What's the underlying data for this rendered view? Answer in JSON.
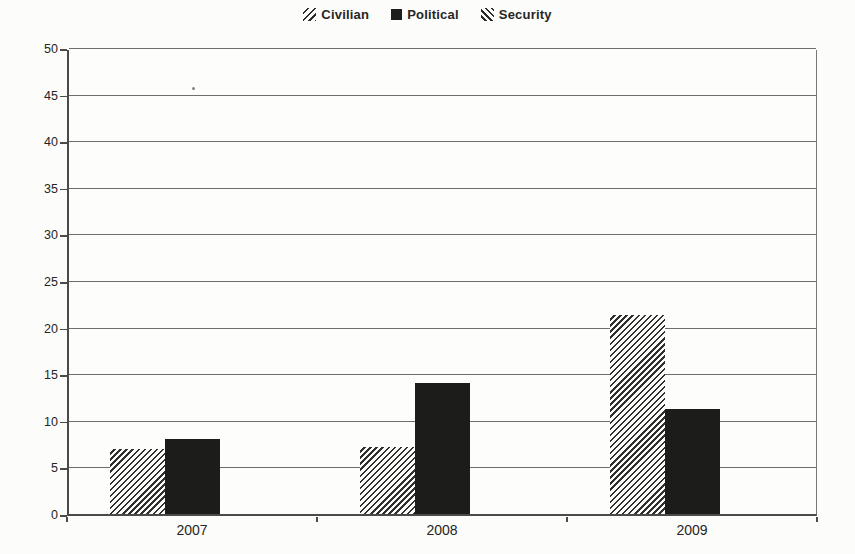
{
  "legend": {
    "position": "top-center",
    "items": [
      {
        "label": "Civilian",
        "marker": "diagonal-hatch-forward-slash"
      },
      {
        "label": "Political",
        "marker": "solid-black-square"
      },
      {
        "label": "Security",
        "marker": "diagonal-hatch-back-slash"
      }
    ]
  },
  "chart_data": {
    "type": "bar",
    "title": "",
    "xlabel": "",
    "ylabel": "",
    "categories": [
      "2007",
      "2008",
      "2009"
    ],
    "series": [
      {
        "name": "Civilian",
        "values": [
          7.0,
          7.2,
          21.3
        ],
        "fill": "hatch-forward"
      },
      {
        "name": "Political",
        "values": [
          8.0,
          14.1,
          11.3
        ],
        "fill": "solid-black"
      },
      {
        "name": "Security",
        "values": [
          42.0,
          37.3,
          43.4
        ],
        "fill": "hatch-back"
      }
    ],
    "ylim": [
      0,
      50
    ],
    "yticks": [
      0,
      5,
      10,
      15,
      20,
      25,
      30,
      35,
      40,
      45,
      50
    ],
    "grid": true,
    "legend_position": "top-center"
  },
  "colors": {
    "ink": "#252523",
    "bar_black": "#1c1c1a",
    "hatch_line": "#2e2e2c",
    "gridline": "#6e6e6c",
    "axis": "#4a4a48",
    "paper": "#fcfcfa"
  }
}
